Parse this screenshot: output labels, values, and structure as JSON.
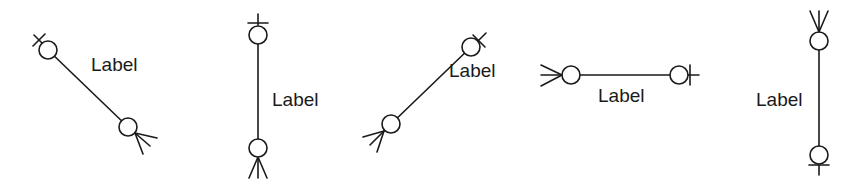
{
  "diagram": {
    "colors": {
      "stroke": "#1a1a1a",
      "background": "#ffffff"
    },
    "relationships": [
      {
        "id": "rel-1",
        "orientation": "diagonal-down-right",
        "label": "Label",
        "end_a": {
          "notation": "zero-or-one",
          "position": "top-left"
        },
        "end_b": {
          "notation": "zero-or-many",
          "position": "bottom-right"
        }
      },
      {
        "id": "rel-2",
        "orientation": "vertical",
        "label": "Label",
        "end_a": {
          "notation": "zero-or-one",
          "position": "top"
        },
        "end_b": {
          "notation": "zero-or-many",
          "position": "bottom"
        }
      },
      {
        "id": "rel-3",
        "orientation": "diagonal-up-right",
        "label": "Label",
        "end_a": {
          "notation": "zero-or-many",
          "position": "bottom-left"
        },
        "end_b": {
          "notation": "zero-or-one",
          "position": "top-right"
        }
      },
      {
        "id": "rel-4",
        "orientation": "horizontal",
        "label": "Label",
        "end_a": {
          "notation": "zero-or-many",
          "position": "left"
        },
        "end_b": {
          "notation": "zero-or-one",
          "position": "right"
        }
      },
      {
        "id": "rel-5",
        "orientation": "vertical",
        "label": "Label",
        "end_a": {
          "notation": "zero-or-many",
          "position": "top"
        },
        "end_b": {
          "notation": "zero-or-one",
          "position": "bottom"
        }
      }
    ]
  }
}
